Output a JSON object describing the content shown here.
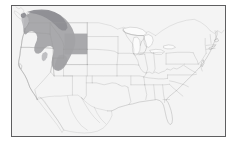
{
  "figure": {
    "type": "distribution-map",
    "title": "",
    "caption": "",
    "region_scope": "Contiguous United States with adjacent Canada and Mexico",
    "background_color": "#ffffff"
  },
  "map": {
    "frame": {
      "border_color": "#5e5e60",
      "border_width_px": 1.5,
      "fill_color": "#fafafa",
      "left_px": 11,
      "top_px": 5,
      "width_px": 215,
      "height_px": 132
    },
    "land_fill_color": "#f4f4f4",
    "state_boundary_color": "#9b9b9b",
    "coastline_color": "#8a8a8a",
    "foreign_boundary_color": "#a6a6a6",
    "lake_fill_color": "#fbfbfb"
  },
  "legend": {
    "visible": false,
    "entries": []
  },
  "shaded_range": {
    "label": "",
    "color": "#a3a3a6",
    "color_dark": "#8e8e93",
    "color_light": "#b9b9bc",
    "description": "Shaded distribution range across the Pacific Northwest and Northern Rocky Mountains",
    "states_covered": [
      "Washington",
      "Oregon",
      "Idaho",
      "Montana",
      "Wyoming",
      "Utah",
      "Nevada",
      "British Columbia"
    ]
  },
  "labels": {
    "axis_labels": [],
    "tick_labels": [],
    "annotations": []
  }
}
